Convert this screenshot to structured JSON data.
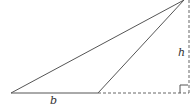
{
  "diagram": {
    "labels": {
      "base": "b",
      "height": "h"
    },
    "colors": {
      "stroke": "#555555",
      "background": "#ffffff"
    }
  }
}
